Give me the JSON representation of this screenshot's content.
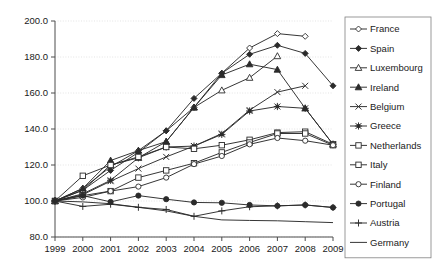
{
  "chart_data": {
    "type": "line",
    "title": "",
    "subtitle": "",
    "xlabel": "",
    "ylabel": "",
    "x": [
      1999,
      2000,
      2001,
      2002,
      2003,
      2004,
      2005,
      2006,
      2007,
      2008,
      2009
    ],
    "xtick_labels": [
      "1999",
      "2000",
      "2001",
      "2002",
      "2003",
      "2004",
      "2005",
      "2006",
      "2007",
      "2008",
      "2009"
    ],
    "ytick_labels": [
      "80.0",
      "100.0",
      "120.0",
      "140.0",
      "160.0",
      "180.0",
      "200.0"
    ],
    "yticks": [
      80,
      100,
      120,
      140,
      160,
      180,
      200
    ],
    "ylim": [
      80,
      200
    ],
    "xlim": [
      1999,
      2009
    ],
    "grid": "horizontal-dotted",
    "legend_position": "right",
    "series": [
      {
        "name": "France",
        "marker": "open-diamond",
        "values": [
          100,
          107,
          119,
          128,
          139,
          152,
          171,
          185,
          193,
          191.5,
          null
        ]
      },
      {
        "name": "Spain",
        "marker": "filled-diamond",
        "values": [
          100,
          106,
          117,
          127,
          139,
          157,
          171,
          181.5,
          186.5,
          182,
          164
        ]
      },
      {
        "name": "Luxembourg",
        "marker": "open-triangle",
        "values": [
          100,
          106,
          120,
          124,
          133,
          152,
          161.5,
          168.5,
          180.5,
          null,
          null
        ]
      },
      {
        "name": "Ireland",
        "marker": "filled-triangle",
        "values": [
          100,
          107,
          122.5,
          128,
          133,
          152,
          170,
          176,
          173,
          151.5,
          131.5
        ]
      },
      {
        "name": "Belgium",
        "marker": "cross-x",
        "values": [
          100,
          103.5,
          111,
          118,
          124.5,
          130.5,
          137.5,
          150.5,
          160.5,
          164,
          null
        ]
      },
      {
        "name": "Greece",
        "marker": "filled-star",
        "values": [
          100,
          104,
          111.5,
          124,
          130,
          130.5,
          137,
          150,
          152.5,
          151.5,
          131.5
        ]
      },
      {
        "name": "Netherlands",
        "marker": "open-square",
        "values": [
          100,
          114,
          120,
          124.5,
          130,
          129,
          131,
          134,
          138,
          138.5,
          131.5
        ]
      },
      {
        "name": "Italy",
        "marker": "open-square",
        "values": [
          100,
          103,
          105.5,
          113,
          117,
          121,
          127,
          132.5,
          137.5,
          137.5,
          131
        ]
      },
      {
        "name": "Finland",
        "marker": "open-circle",
        "values": [
          100,
          102,
          105.5,
          108,
          113,
          120.5,
          125,
          131.5,
          135,
          133.5,
          131
        ]
      },
      {
        "name": "Portugal",
        "marker": "filled-circle",
        "values": [
          100,
          103,
          99.5,
          103,
          101,
          99.2,
          99,
          97.8,
          97.3,
          97.8,
          96.4
        ]
      },
      {
        "name": "Austria",
        "marker": "plus",
        "values": [
          100,
          97,
          98.2,
          96.5,
          95.3,
          91.5,
          94.5,
          96.8,
          97.3,
          97.8,
          96.4
        ]
      },
      {
        "name": "Germany",
        "marker": "none",
        "values": [
          100,
          99.5,
          98.5,
          96.5,
          94.5,
          91.5,
          89.5,
          89.2,
          89,
          88.5,
          88
        ]
      }
    ]
  },
  "legend": {
    "items": [
      {
        "label": "France"
      },
      {
        "label": "Spain"
      },
      {
        "label": "Luxembourg"
      },
      {
        "label": "Ireland"
      },
      {
        "label": "Belgium"
      },
      {
        "label": "Greece"
      },
      {
        "label": "Netherlands"
      },
      {
        "label": "Italy"
      },
      {
        "label": "Finland"
      },
      {
        "label": "Portugal"
      },
      {
        "label": "Austria"
      },
      {
        "label": "Germany"
      }
    ]
  },
  "colors": {
    "line": "#2b2b2b",
    "grid": "#d9d9d9",
    "axis": "#4d4d4d",
    "background": "#ffffff",
    "legend_border": "#808080"
  }
}
